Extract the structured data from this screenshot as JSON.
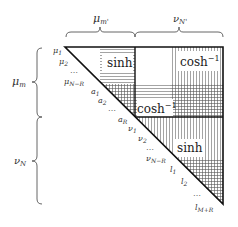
{
  "top_braces": [
    {
      "label": "μ",
      "sub": "m'"
    },
    {
      "label": "ν",
      "sub": "N'"
    }
  ],
  "left_braces": [
    {
      "label": "μ",
      "sub": "m"
    },
    {
      "label": "ν",
      "sub": "N"
    }
  ],
  "diagonal_labels": [
    {
      "base": "μ",
      "sub": "1"
    },
    {
      "base": "μ",
      "sub": "2"
    },
    {
      "base": "…",
      "sub": ""
    },
    {
      "base": "μ",
      "sub": "N−R"
    },
    {
      "base": "a",
      "sub": "1"
    },
    {
      "base": "a",
      "sub": "2"
    },
    {
      "base": "…",
      "sub": ""
    },
    {
      "base": "a",
      "sub": "R"
    },
    {
      "base": "ν",
      "sub": "1"
    },
    {
      "base": "ν",
      "sub": "2"
    },
    {
      "base": "…",
      "sub": ""
    },
    {
      "base": "ν",
      "sub": "N−R"
    },
    {
      "base": "l",
      "sub": "1"
    },
    {
      "base": "l",
      "sub": "2"
    },
    {
      "base": "…",
      "sub": ""
    },
    {
      "base": "l",
      "sub": "M+R"
    }
  ],
  "blocks": {
    "top_left": {
      "fn": "sinh",
      "sup": ""
    },
    "top_right": {
      "fn": "cosh",
      "sup": "−1"
    },
    "middle": {
      "fn": "cosh",
      "sup": "−1"
    },
    "bottom_right": {
      "fn": "sinh",
      "sup": ""
    }
  }
}
